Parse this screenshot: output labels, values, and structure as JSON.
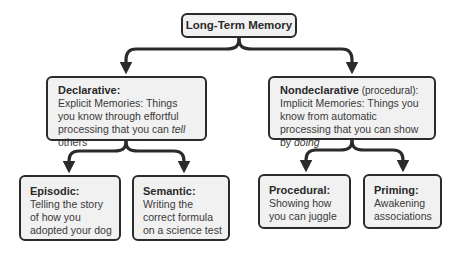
{
  "diagram": {
    "type": "hierarchy",
    "colors": {
      "node_fill": "#f1f1f1",
      "node_border": "#2b2b2b",
      "connector": "#2b2b2b",
      "text": "#333333"
    },
    "root": {
      "label": "Long-Term Memory"
    },
    "branches": [
      {
        "title": "Declarative:",
        "qualifier": "",
        "desc_before": "Explicit Memories: Things you know through effortful processing that you can ",
        "desc_emph": "tell",
        "desc_after": " others",
        "children": [
          {
            "title": "Episodic:",
            "desc": "Telling the story of how you adopted your dog"
          },
          {
            "title": "Semantic:",
            "desc": "Writing the correct formula on a science test"
          }
        ]
      },
      {
        "title": "Nondeclarative",
        "qualifier": " (procedural):",
        "desc_before": "Implicit Memories: Things you know from automatic processing that you can show by ",
        "desc_emph": "doing",
        "desc_after": "",
        "children": [
          {
            "title": "Procedural:",
            "desc": "Showing how you can juggle"
          },
          {
            "title": "Priming:",
            "desc": "Awakening associations"
          }
        ]
      }
    ],
    "edges": [
      [
        "Long-Term Memory",
        "Declarative"
      ],
      [
        "Long-Term Memory",
        "Nondeclarative"
      ],
      [
        "Declarative",
        "Episodic"
      ],
      [
        "Declarative",
        "Semantic"
      ],
      [
        "Nondeclarative",
        "Procedural"
      ],
      [
        "Nondeclarative",
        "Priming"
      ]
    ]
  }
}
